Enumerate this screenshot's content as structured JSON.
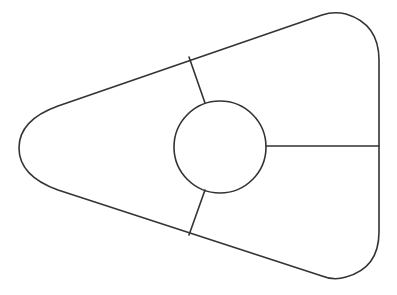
{
  "diagram": {
    "type": "rounded-triangle-sectioned",
    "background": "#ffffff",
    "stroke_color": "#333333",
    "stroke_width": 1.6,
    "outline": {
      "description": "Rounded triangle pointing left with flat right side",
      "left_apex": [
        19,
        148
      ],
      "top_right_apex": [
        334,
        12
      ],
      "bottom_right_apex": [
        334,
        279
      ],
      "right_edge_x": 379
    },
    "center_circle": {
      "cx": 220,
      "cy": 147,
      "r": 46
    },
    "dividers": [
      {
        "name": "upper-divider",
        "x1": 189,
        "y1": 57,
        "x2": 205,
        "y2": 103
      },
      {
        "name": "right-divider",
        "x1": 266,
        "y1": 146,
        "x2": 379,
        "y2": 146
      },
      {
        "name": "lower-divider",
        "x1": 189,
        "y1": 235,
        "x2": 205,
        "y2": 190
      }
    ],
    "sections": [
      {
        "name": "left-section",
        "label": ""
      },
      {
        "name": "upper-right-section",
        "label": ""
      },
      {
        "name": "lower-right-section",
        "label": ""
      },
      {
        "name": "center-section",
        "label": ""
      }
    ]
  }
}
